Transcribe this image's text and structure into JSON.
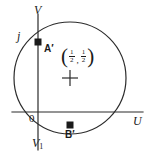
{
  "figure": {
    "kind": "geometry-diagram",
    "stroke_color": "#2b2b2b",
    "background_color": "#ffffff"
  },
  "axes": {
    "horizontal": {
      "label": "U",
      "x_start": 12,
      "x_end": 143,
      "y": 112
    },
    "vertical": {
      "label_top": "V",
      "label_bottom": "V",
      "label_bottom_subscript": "1",
      "x": 38,
      "y_start": 14,
      "y_end": 150
    },
    "origin_label": "0",
    "origin": {
      "x": 38,
      "y": 112
    }
  },
  "circle": {
    "center": {
      "x": 70,
      "y": 78
    },
    "radius": 56,
    "center_label_open_paren": "(",
    "center_label_close_paren": ")",
    "center_label_separator": ",",
    "center_coordinate_x_numerator": "1",
    "center_coordinate_x_denominator": "2",
    "center_coordinate_y_numerator": "1",
    "center_coordinate_y_denominator": "2",
    "center_marker": "plus-marker"
  },
  "points": [
    {
      "label": "A′",
      "name": "point-a-prime",
      "x": 38,
      "y": 42,
      "marker": "filled-square",
      "axis_tick_label": "j"
    },
    {
      "label": "B′",
      "name": "point-b-prime",
      "x": 70,
      "y": 125,
      "marker": "filled-square",
      "axis_tick_label": ""
    }
  ],
  "tick_labels": {
    "imaginary_unit": "j",
    "origin": "0"
  }
}
